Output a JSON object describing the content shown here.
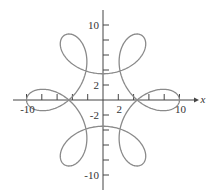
{
  "chart_data": {
    "type": "line",
    "title": "",
    "xlabel": "x",
    "ylabel": "",
    "xlim": [
      -11.5,
      12
    ],
    "ylim": [
      -11.5,
      12
    ],
    "grid": false,
    "legend": null,
    "x_tick_labels": [
      {
        "value": -10,
        "label": "-10"
      },
      {
        "value": 2,
        "label": "2"
      },
      {
        "value": 10,
        "label": "10"
      }
    ],
    "y_tick_labels": [
      {
        "value": 10,
        "label": "10"
      },
      {
        "value": 2,
        "label": "2"
      },
      {
        "value": -2,
        "label": "-2"
      },
      {
        "value": -10,
        "label": "-10"
      }
    ],
    "tick_step": 2,
    "curve": {
      "kind": "parametric",
      "description": "six-lobed closed curve with six inner loops",
      "x_of_t": "6.75*cos(t) + 3.25*cos(5t)",
      "y_of_t": "6.75*sin(t) - 3.25*sin(5t)",
      "t_range": [
        0,
        6.2832
      ],
      "color": "#8a8a8a"
    }
  },
  "colors": {
    "axis": "#444444",
    "curve": "#8a8a8a"
  }
}
